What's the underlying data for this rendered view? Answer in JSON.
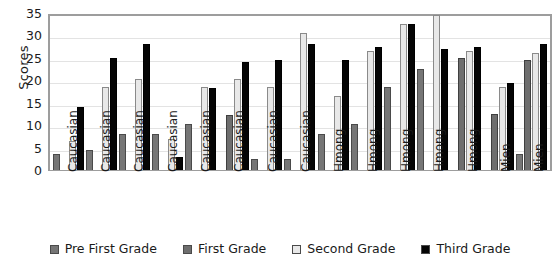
{
  "chart_data": {
    "type": "bar",
    "title": "",
    "xlabel": "",
    "ylabel": "Scores",
    "ylim": [
      0,
      35
    ],
    "yticks": [
      0,
      5,
      10,
      15,
      20,
      25,
      30,
      35
    ],
    "grid": true,
    "legend_position": "bottom",
    "categories": [
      "Caucasian",
      "Caucasian",
      "Caucasian",
      "Caucasian",
      "Caucasian",
      "Caucasian",
      "Caucasian",
      "Caucasian",
      "Hmong",
      "Hmong",
      "Hmong",
      "Hmong",
      "Hmong",
      "Mien",
      "Mien"
    ],
    "series": [
      {
        "name": "Pre First Grade",
        "color": "#767676",
        "values": [
          3.5,
          4.5,
          8,
          8,
          10.3,
          null,
          2.5,
          2.5,
          8,
          10.3,
          18.5,
          22.5,
          null,
          null,
          3.5
        ]
      },
      {
        "name": "First Grade",
        "color": "#6e6e6e",
        "values": [
          null,
          null,
          null,
          null,
          null,
          12.3,
          null,
          null,
          null,
          null,
          null,
          null,
          25,
          12.5,
          24.5
        ]
      },
      {
        "name": "Second Grade",
        "color": "#e8e8e8",
        "values": [
          6.5,
          18.5,
          20.3,
          7,
          18.5,
          20.3,
          18.5,
          30.5,
          16.5,
          26.5,
          32.5,
          34.5,
          26.5,
          18.5,
          26
        ]
      },
      {
        "name": "Third Grade",
        "color": "#050505",
        "values": [
          14,
          25,
          28,
          3,
          18.3,
          24,
          24.5,
          28,
          24.5,
          27.5,
          32.5,
          27,
          27.5,
          19.5,
          28
        ]
      }
    ]
  },
  "legend": {
    "items": [
      {
        "label": "Pre First Grade"
      },
      {
        "label": "First Grade"
      },
      {
        "label": "Second Grade"
      },
      {
        "label": "Third Grade"
      }
    ]
  }
}
